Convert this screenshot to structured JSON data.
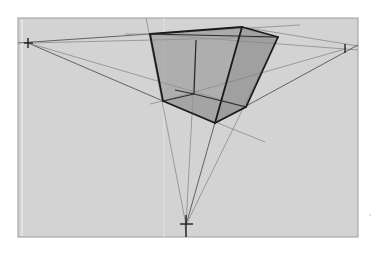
{
  "canvas": {
    "x": 18,
    "y": 18,
    "width": 340,
    "height": 219,
    "fill": "#d3d3d3",
    "border": "#9c9c9c"
  },
  "colors": {
    "face_shade_left": "#8f8f8f",
    "face_shade_right": "#7e7e7e",
    "face_shade_bottom": "#9a9a9a",
    "guide_line": "#8a8a8a",
    "edge_line": "#1a1a1a"
  },
  "vanishing_points": [
    {
      "name": "left",
      "x": 28,
      "y": 43
    },
    {
      "name": "right",
      "x": 345,
      "y": 49
    },
    {
      "name": "bottom",
      "x": 186,
      "y": 225
    }
  ],
  "box": {
    "top_left": {
      "x": 150,
      "y": 34
    },
    "top_back": {
      "x": 196,
      "y": 40
    },
    "top_right_front": {
      "x": 242,
      "y": 27
    },
    "top_right": {
      "x": 278,
      "y": 37
    },
    "bottom_left": {
      "x": 163,
      "y": 101
    },
    "bottom_back": {
      "x": 194,
      "y": 94
    },
    "bottom_front": {
      "x": 215,
      "y": 123
    },
    "bottom_right": {
      "x": 246,
      "y": 107
    }
  }
}
